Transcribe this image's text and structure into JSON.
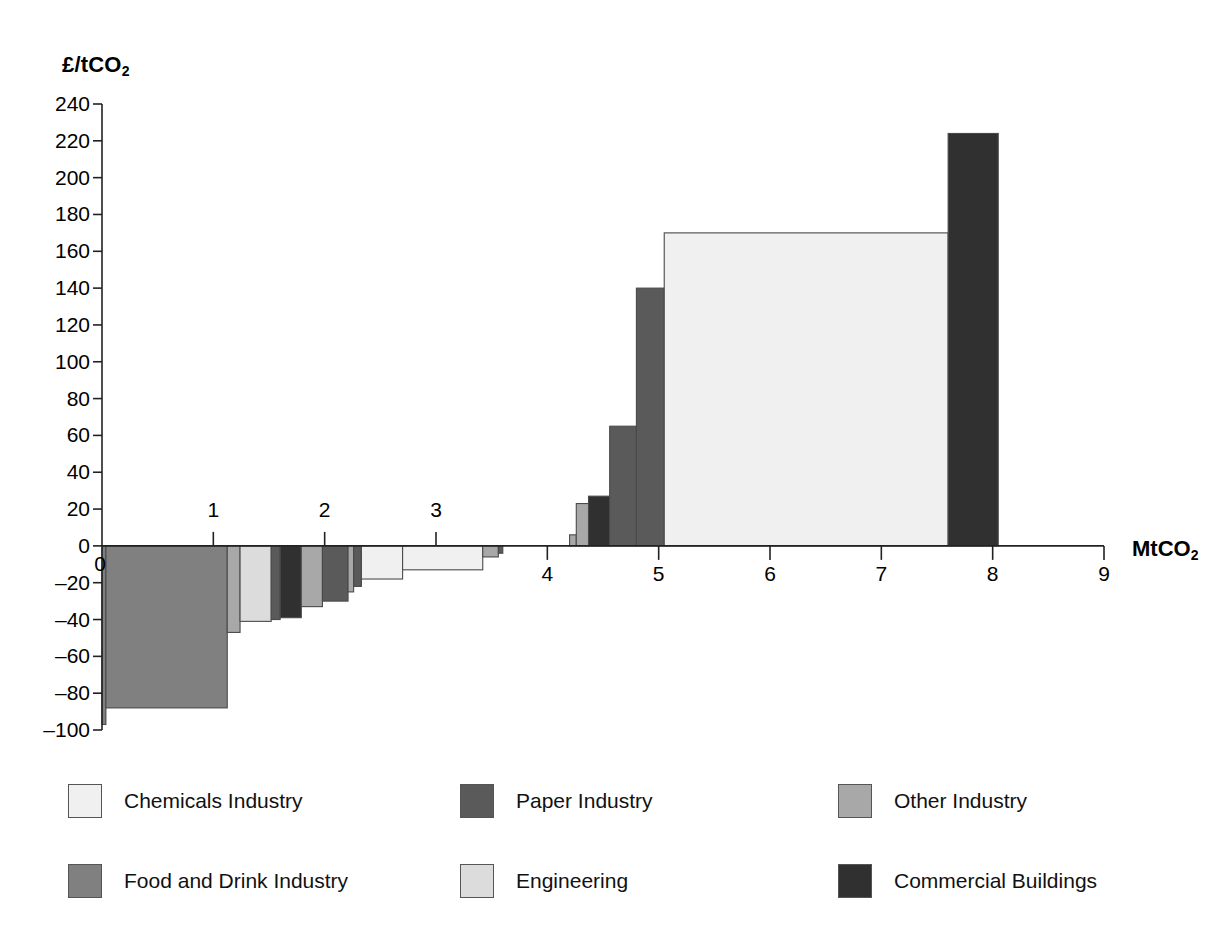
{
  "chart_data": {
    "type": "bar",
    "title": "",
    "subtitle": "",
    "xlabel": "MtCO2",
    "ylabel": "£/tCO2",
    "xlabel_display": "MtCO",
    "xlabel_sub": "2",
    "ylabel_display": "£/tCO",
    "ylabel_sub": "2",
    "xlim": [
      0,
      9
    ],
    "ylim": [
      -100,
      240
    ],
    "xticks": [
      0,
      1,
      2,
      3,
      4,
      5,
      6,
      7,
      8,
      9
    ],
    "xtick_labels": [
      "0",
      "1",
      "2",
      "3",
      "4",
      "5",
      "6",
      "7",
      "8",
      "9"
    ],
    "yticks": [
      240,
      220,
      200,
      180,
      160,
      140,
      120,
      100,
      80,
      60,
      40,
      20,
      0,
      -20,
      -40,
      -60,
      -80,
      -100
    ],
    "ytick_labels": [
      "240",
      "220",
      "200",
      "180",
      "160",
      "140",
      "120",
      "100",
      "80",
      "60",
      "40",
      "20",
      "0",
      "–20",
      "–40",
      "–60",
      "–80",
      "–100"
    ],
    "grid": false,
    "legend_position": "below",
    "note": "Marginal abatement cost curve: bar width = abatement potential (MtCO2), bar height = cost (£/tCO2)",
    "series_colors": {
      "Chemicals Industry": "#f0f0f0",
      "Food and Drink Industry": "#808080",
      "Paper Industry": "#5a5a5a",
      "Engineering": "#dcdcdc",
      "Other Industry": "#a8a8a8",
      "Commercial Buildings": "#303030"
    },
    "bars": [
      {
        "label": "Food and Drink Industry",
        "x_start": 0.0,
        "x_end": 0.035,
        "value": -97
      },
      {
        "label": "Food and Drink Industry",
        "x_start": 0.035,
        "x_end": 1.125,
        "value": -88
      },
      {
        "label": "Other Industry",
        "x_start": 1.125,
        "x_end": 1.24,
        "value": -47
      },
      {
        "label": "Engineering",
        "x_start": 1.24,
        "x_end": 1.52,
        "value": -41
      },
      {
        "label": "Paper Industry",
        "x_start": 1.52,
        "x_end": 1.6,
        "value": -40
      },
      {
        "label": "Commercial Buildings",
        "x_start": 1.6,
        "x_end": 1.79,
        "value": -39
      },
      {
        "label": "Other Industry",
        "x_start": 1.79,
        "x_end": 1.98,
        "value": -33
      },
      {
        "label": "Paper Industry",
        "x_start": 1.98,
        "x_end": 2.21,
        "value": -30
      },
      {
        "label": "Other Industry",
        "x_start": 2.21,
        "x_end": 2.26,
        "value": -25
      },
      {
        "label": "Paper Industry",
        "x_start": 2.26,
        "x_end": 2.33,
        "value": -22
      },
      {
        "label": "Chemicals Industry",
        "x_start": 2.33,
        "x_end": 2.7,
        "value": -18
      },
      {
        "label": "Chemicals Industry",
        "x_start": 2.7,
        "x_end": 3.42,
        "value": -13
      },
      {
        "label": "Other Industry",
        "x_start": 3.42,
        "x_end": 3.56,
        "value": -6
      },
      {
        "label": "Paper Industry",
        "x_start": 3.56,
        "x_end": 3.6,
        "value": -4
      },
      {
        "label": "Other Industry",
        "x_start": 4.2,
        "x_end": 4.26,
        "value": 6
      },
      {
        "label": "Other Industry",
        "x_start": 4.26,
        "x_end": 4.37,
        "value": 23
      },
      {
        "label": "Commercial Buildings",
        "x_start": 4.37,
        "x_end": 4.56,
        "value": 27
      },
      {
        "label": "Paper Industry",
        "x_start": 4.56,
        "x_end": 4.8,
        "value": 65
      },
      {
        "label": "Paper Industry",
        "x_start": 4.8,
        "x_end": 5.05,
        "value": 140
      },
      {
        "label": "Chemicals Industry",
        "x_start": 5.05,
        "x_end": 7.6,
        "value": 170
      },
      {
        "label": "Commercial Buildings",
        "x_start": 7.6,
        "x_end": 8.05,
        "value": 224
      }
    ]
  },
  "legend": {
    "items": [
      {
        "label": "Chemicals Industry",
        "color": "#f0f0f0"
      },
      {
        "label": "Paper Industry",
        "color": "#5a5a5a"
      },
      {
        "label": "Other Industry",
        "color": "#a8a8a8"
      },
      {
        "label": "Food and Drink Industry",
        "color": "#808080"
      },
      {
        "label": "Engineering",
        "color": "#dcdcdc"
      },
      {
        "label": "Commercial Buildings",
        "color": "#303030"
      }
    ]
  }
}
